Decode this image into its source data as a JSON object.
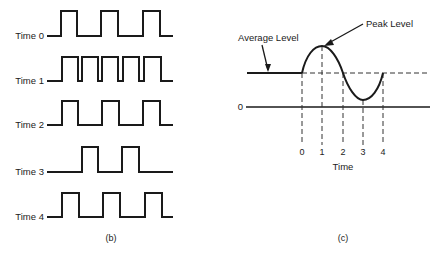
{
  "panel_b": {
    "caption": "(b)",
    "rows": [
      {
        "label": "Time 0",
        "baseline_y": 36,
        "high_y": 11,
        "edges": [
          61,
          77,
          101,
          118,
          143,
          160
        ]
      },
      {
        "label": "Time 1",
        "baseline_y": 81,
        "high_y": 57,
        "edges": [
          62,
          78,
          82,
          98,
          102,
          118,
          123,
          139,
          144,
          161
        ]
      },
      {
        "label": "Time 2",
        "baseline_y": 125,
        "high_y": 101,
        "edges": [
          62,
          78,
          102,
          119,
          143,
          160
        ]
      },
      {
        "label": "Time 3",
        "baseline_y": 172,
        "high_y": 147,
        "edges": [
          82,
          98,
          122,
          139
        ]
      },
      {
        "label": "Time 4",
        "baseline_y": 217,
        "high_y": 193,
        "edges": [
          62,
          79,
          103,
          120,
          145,
          162
        ]
      }
    ],
    "x_start": 47,
    "x_end": 173
  },
  "panel_c": {
    "caption": "(c)",
    "average_label": "Average Level",
    "peak_label": "Peak Level",
    "zero_label": "0",
    "x_axis_label": "Time",
    "ticks": [
      "0",
      "1",
      "2",
      "3",
      "4"
    ],
    "tick_x": [
      302,
      322,
      343,
      363,
      383
    ]
  }
}
